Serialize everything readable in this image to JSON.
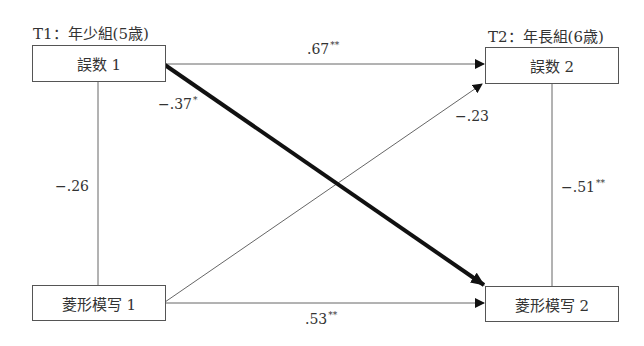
{
  "time_labels": {
    "t1": "T1：年少組(5歳)",
    "t2": "T2：年長組(6歳)"
  },
  "nodes": {
    "errors1": "誤数 1",
    "errors2": "誤数 2",
    "diamond1": "菱形模写 1",
    "diamond2": "菱形模写 2"
  },
  "paths": {
    "errors1_to_errors2": {
      "value": ".67",
      "sig": "**"
    },
    "errors1_to_diamond2": {
      "value": "−.37",
      "sig": "*"
    },
    "diamond1_to_errors2": {
      "value": "−.23",
      "sig": ""
    },
    "diamond1_to_diamond2": {
      "value": ".53",
      "sig": "**"
    },
    "corr_t1": {
      "value": "−.26",
      "sig": ""
    },
    "corr_t2": {
      "value": "−.51",
      "sig": "**"
    }
  },
  "colors": {
    "line": "#555555",
    "bold_line": "#111111"
  }
}
